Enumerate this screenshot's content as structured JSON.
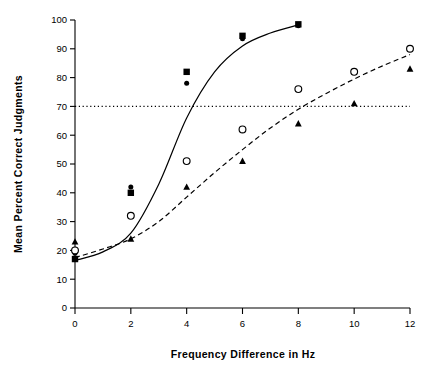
{
  "chart_data": {
    "type": "scatter",
    "title": "",
    "xlabel": "Frequency Difference in Hz",
    "ylabel": "Mean Percent Correct Judgments",
    "xlim": [
      0,
      12
    ],
    "ylim": [
      0,
      100
    ],
    "xticks": [
      0,
      2,
      4,
      6,
      8,
      10,
      12
    ],
    "yticks": [
      0,
      10,
      20,
      30,
      40,
      50,
      60,
      70,
      80,
      90,
      100
    ],
    "xtick_labels": [
      "0",
      "2",
      "4",
      "6",
      "8",
      "10",
      "12"
    ],
    "ytick_labels": [
      "0",
      "10",
      "20",
      "30",
      "40",
      "50",
      "60",
      "70",
      "80",
      "90",
      "100"
    ],
    "grid": false,
    "legend_position": "lower-right",
    "reference_line": {
      "label": "70 percent criterion",
      "y": 70,
      "style": "dotted",
      "x_start": 0,
      "x_end": 12
    },
    "series": [
      {
        "name": "Normal, Δf above 1KHz",
        "marker": "filled-circle",
        "group": "Normal",
        "condition": "Δf above 1KHz",
        "line": "solid",
        "x": [
          0,
          2,
          4,
          6,
          8
        ],
        "values": [
          19,
          42,
          78,
          93.5,
          98
        ]
      },
      {
        "name": "Normal, Δf below 1KHz",
        "marker": "filled-square",
        "group": "Normal",
        "condition": "Δf below 1KHz",
        "line": "solid",
        "x": [
          0,
          2,
          4,
          6,
          8
        ],
        "values": [
          17,
          40,
          82,
          94.5,
          98.5
        ]
      },
      {
        "name": "MR, Δf above 1KHz",
        "marker": "open-circle",
        "group": "MR",
        "condition": "Δf above 1KHz",
        "line": "dashed",
        "x": [
          0,
          2,
          4,
          6,
          8,
          10,
          12
        ],
        "values": [
          20,
          32,
          51,
          62,
          76,
          82,
          90
        ]
      },
      {
        "name": "MR, Δf below 1KHz",
        "marker": "filled-triangle",
        "group": "MR",
        "condition": "Δf below 1KHz",
        "line": "dashed",
        "x": [
          0,
          2,
          4,
          6,
          8,
          10,
          12
        ],
        "values": [
          23,
          24,
          42,
          51,
          64,
          71,
          83
        ]
      }
    ],
    "fit_curves": [
      {
        "name": "Normal fit",
        "style": "solid",
        "points": [
          [
            0,
            16.5
          ],
          [
            1,
            19.5
          ],
          [
            2,
            26
          ],
          [
            3,
            43
          ],
          [
            4,
            66
          ],
          [
            5,
            82
          ],
          [
            6,
            91
          ],
          [
            7,
            95.5
          ],
          [
            8,
            98.3
          ]
        ]
      },
      {
        "name": "MR fit",
        "style": "dashed",
        "points": [
          [
            0,
            17.5
          ],
          [
            1,
            20.5
          ],
          [
            2,
            24
          ],
          [
            3,
            30
          ],
          [
            4,
            38.5
          ],
          [
            5,
            47
          ],
          [
            6,
            55
          ],
          [
            7,
            62.5
          ],
          [
            8,
            69
          ],
          [
            9,
            74.5
          ],
          [
            10,
            79.5
          ],
          [
            11,
            84
          ],
          [
            12,
            88
          ]
        ]
      }
    ]
  },
  "legend": {
    "headers": [
      "Normal",
      "MR"
    ],
    "rows": [
      {
        "label": "Δf above  1KHz",
        "normal_marker": "filled-circle",
        "mr_marker": "open-circle"
      },
      {
        "label": "Δf below  1KHz",
        "normal_marker": "filled-square",
        "mr_marker": "filled-triangle"
      }
    ]
  },
  "colors": {
    "ink": "#000000",
    "background": "#ffffff"
  }
}
